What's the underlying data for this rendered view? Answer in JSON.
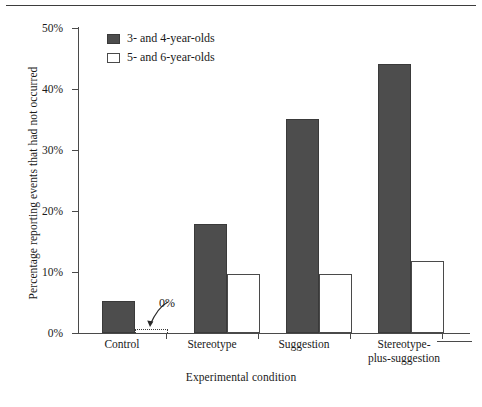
{
  "chart_data": {
    "type": "bar",
    "title": "",
    "xlabel": "Experimental condition",
    "ylabel": "Percentage reporting events that had not occurred",
    "categories": [
      "Control",
      "Stereotype",
      "Suggestion",
      "Stereotype-\nplus-suggestion"
    ],
    "category_labels": [
      [
        "Control"
      ],
      [
        "Stereotype"
      ],
      [
        "Suggestion"
      ],
      [
        "Stereotype-",
        "plus-suggestion"
      ]
    ],
    "series": [
      {
        "name": "3- and 4-year-olds",
        "color": "#4d4d4d",
        "values": [
          5.2,
          17.8,
          35.0,
          44.0
        ]
      },
      {
        "name": "5- and 6-year-olds",
        "color": "#ffffff",
        "values": [
          0,
          9.6,
          9.7,
          11.7
        ]
      }
    ],
    "ylim": [
      0,
      50
    ],
    "ytick_values": [
      0,
      10,
      20,
      30,
      40,
      50
    ],
    "ytick_labels": [
      "0%",
      "10%",
      "20%",
      "30%",
      "40%",
      "50%"
    ],
    "grid": false,
    "legend_position": "upper left inside",
    "annotations": [
      {
        "text": "0%",
        "target_series": "5- and 6-year-olds",
        "target_category": "Control",
        "target_value": 0,
        "style": "curved arrow to dotted zero-height bar"
      }
    ]
  },
  "legend": {
    "items": [
      {
        "label": "3- and 4-year-olds",
        "swatch": "filled-dark-square"
      },
      {
        "label": "5- and 6-year-olds",
        "swatch": "open-white-square"
      }
    ]
  },
  "axes": {
    "y_title": "Percentage reporting events that had not occurred",
    "x_title": "Experimental condition",
    "y_ticks": [
      "0%",
      "10%",
      "20%",
      "30%",
      "40%",
      "50%"
    ]
  },
  "annotation": {
    "zero_label": "0%"
  },
  "colors": {
    "bar_dark": "#4d4d4d",
    "bar_light": "#ffffff",
    "axis": "#4a4a4a",
    "text": "#1a1a1a"
  }
}
